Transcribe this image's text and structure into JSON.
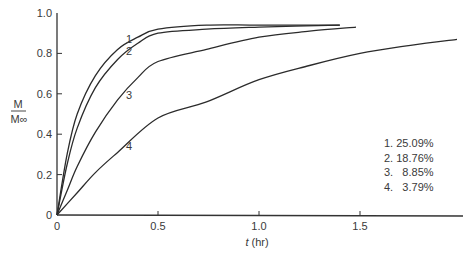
{
  "chart_data": {
    "type": "line",
    "title": "",
    "xlabel": "t (hr)",
    "ylabel": "M / M∞",
    "ylabel_numerator": "M",
    "ylabel_denominator": "M∞",
    "xlim": [
      0,
      2.0
    ],
    "ylim": [
      0,
      1.0
    ],
    "x_ticks": [
      0,
      0.5,
      1.0,
      1.5
    ],
    "x_tick_labels": [
      "0",
      "0.5",
      "1.0",
      "1.5"
    ],
    "y_ticks": [
      0,
      0.2,
      0.4,
      0.6,
      0.8,
      1.0
    ],
    "y_tick_labels": [
      "0",
      "0.2",
      "0.4",
      "0.6",
      "0.8",
      "1.0"
    ],
    "grid": false,
    "legend_position": "lower right (inside)",
    "series": [
      {
        "name": "1",
        "curve_label": "1",
        "legend": "1. 25.09%",
        "x": [
          0,
          0.05,
          0.1,
          0.19,
          0.3,
          0.4,
          0.5,
          0.74,
          1.0,
          1.4
        ],
        "y": [
          0,
          0.3,
          0.5,
          0.69,
          0.82,
          0.88,
          0.92,
          0.94,
          0.94,
          0.94
        ]
      },
      {
        "name": "2",
        "curve_label": "2",
        "legend": "2. 18.76%",
        "x": [
          0,
          0.05,
          0.1,
          0.19,
          0.3,
          0.4,
          0.5,
          0.74,
          1.0,
          1.4
        ],
        "y": [
          0,
          0.25,
          0.43,
          0.63,
          0.77,
          0.85,
          0.9,
          0.92,
          0.93,
          0.94
        ]
      },
      {
        "name": "3",
        "curve_label": "3",
        "legend": "3.   8.85%",
        "x": [
          0,
          0.05,
          0.1,
          0.19,
          0.3,
          0.4,
          0.5,
          0.74,
          1.0,
          1.25,
          1.48
        ],
        "y": [
          0,
          0.12,
          0.24,
          0.41,
          0.57,
          0.68,
          0.76,
          0.82,
          0.88,
          0.91,
          0.93
        ]
      },
      {
        "name": "4",
        "curve_label": "4",
        "legend": "4.   3.79%",
        "x": [
          0,
          0.1,
          0.19,
          0.3,
          0.5,
          0.74,
          1.0,
          1.25,
          1.5,
          1.75,
          1.98
        ],
        "y": [
          0,
          0.11,
          0.21,
          0.31,
          0.48,
          0.56,
          0.67,
          0.74,
          0.8,
          0.84,
          0.87
        ]
      }
    ]
  },
  "legend": {
    "items": [
      "1. 25.09%",
      "2. 18.76%",
      "3.   8.85%",
      "4.   3.79%"
    ]
  }
}
